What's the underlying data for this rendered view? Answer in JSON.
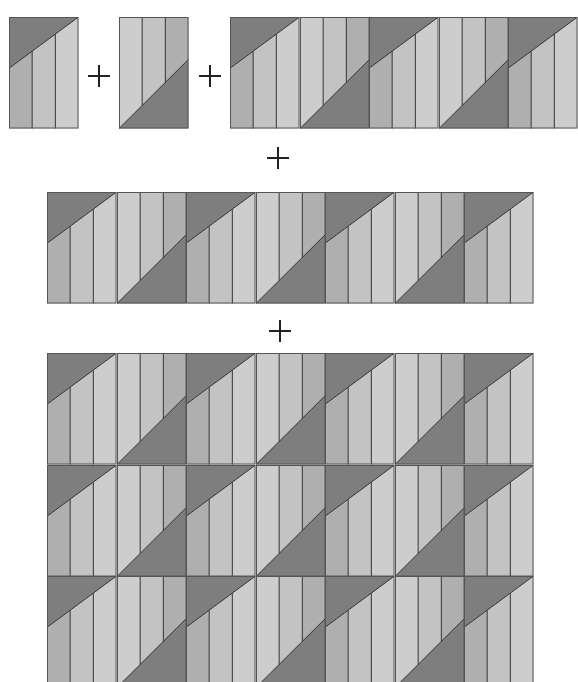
{
  "diagram": {
    "colors": {
      "dark_triangle": "#7e7e7e",
      "strip_dark": "#afafaf",
      "strip_mid": "#c3c3c3",
      "strip_light": "#cdcdcd",
      "seam": "#333333",
      "background": "#ffffff"
    },
    "block_types": {
      "A": "dark triangle at top-left, three vertical strips (dark, mid, light) below diagonal",
      "B": "dark triangle at bottom-right, three vertical strips (light, mid, dark) above diagonal"
    },
    "steps": [
      {
        "label": "Block A",
        "sequence": [
          "A"
        ]
      },
      {
        "operator": "+"
      },
      {
        "label": "Block B",
        "sequence": [
          "B"
        ]
      },
      {
        "operator": "+"
      },
      {
        "label": "Pair strip (top row)",
        "sequence": [
          "A",
          "B",
          "A",
          "B",
          "A"
        ]
      },
      {
        "operator": "+"
      },
      {
        "label": "Row strip",
        "sequence": [
          "A",
          "B",
          "A",
          "B",
          "A",
          "B",
          "A"
        ]
      },
      {
        "operator": "+"
      },
      {
        "label": "Quilt grid",
        "rows": 3,
        "sequence": [
          "A",
          "B",
          "A",
          "B",
          "A",
          "B",
          "A"
        ]
      }
    ],
    "operators": [
      "+",
      "+",
      "+",
      "+"
    ]
  }
}
